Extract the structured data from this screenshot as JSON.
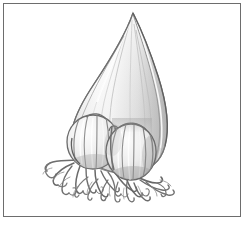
{
  "figure": {
    "medium": "graphite pencil drawing",
    "caption_text": "",
    "frame": {
      "border_color": "#6d6d6d",
      "background_color": "#ffffff",
      "x": 3,
      "y": 3,
      "width": 238,
      "height": 214
    },
    "palette": {
      "paper_white": "#ffffff",
      "highlight": "#fafafa",
      "light_shade": "#ededed",
      "mid_shade": "#d9d9d9",
      "deep_shade": "#bdbdbd",
      "outline": "#8a8a8a",
      "outline_dark": "#5d5d5d",
      "root_ink": "#777777",
      "root_ink_dark": "#4f4f4f"
    },
    "parts": [
      {
        "name": "main-bulb",
        "label": "Main bulb",
        "description": "Large pointed teardrop bulb, tapering to a sharp tip at top, broadest and rounded at base",
        "tip_point": [
          133,
          13
        ],
        "left_extent": 72,
        "right_extent": 167,
        "base_y": 172,
        "shading": "light on the left face, mid-grey on the right face with vertical scale ridges"
      },
      {
        "name": "bulblet-left",
        "label": "Left offset bulblet",
        "description": "Small segmented bulblet attached at lower left of the main bulb",
        "center": [
          93,
          142
        ],
        "rx": 25,
        "ry": 26,
        "segments": 5
      },
      {
        "name": "bulblet-right",
        "label": "Right offset bulblet",
        "description": "Small segmented bulblet attached at lower centre-right of the main bulb",
        "center": [
          131,
          152
        ],
        "rx": 24,
        "ry": 27,
        "segments": 5
      },
      {
        "name": "root-mass",
        "label": "Fibrous roots",
        "description": "Wiry tangled roots spreading down and sideways from the base of the bulb and bulblets",
        "span_x": [
          44,
          178
        ],
        "span_y": [
          158,
          202
        ],
        "strand_count": 34
      }
    ]
  }
}
